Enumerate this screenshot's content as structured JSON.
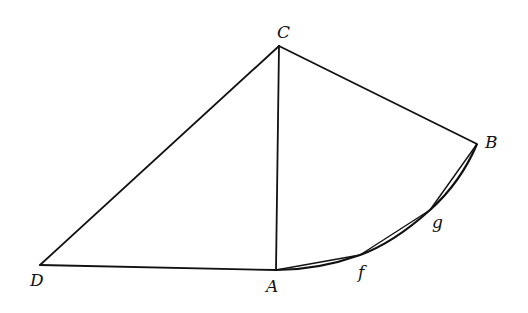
{
  "diagram": {
    "type": "geometric-construction",
    "points": {
      "C": {
        "label": "C",
        "x": 279,
        "y": 46
      },
      "B": {
        "label": "B",
        "x": 477,
        "y": 144
      },
      "D": {
        "label": "D",
        "x": 40,
        "y": 265
      },
      "A": {
        "label": "A",
        "x": 276,
        "y": 270
      },
      "f": {
        "label": "f",
        "x": 360,
        "y": 255
      },
      "g": {
        "label": "g",
        "x": 430,
        "y": 210
      }
    },
    "segments": [
      "C-D",
      "C-A",
      "C-B",
      "D-A"
    ],
    "arc": "A-f-g-B",
    "chords": [
      "A-f",
      "f-g",
      "g-B"
    ]
  }
}
